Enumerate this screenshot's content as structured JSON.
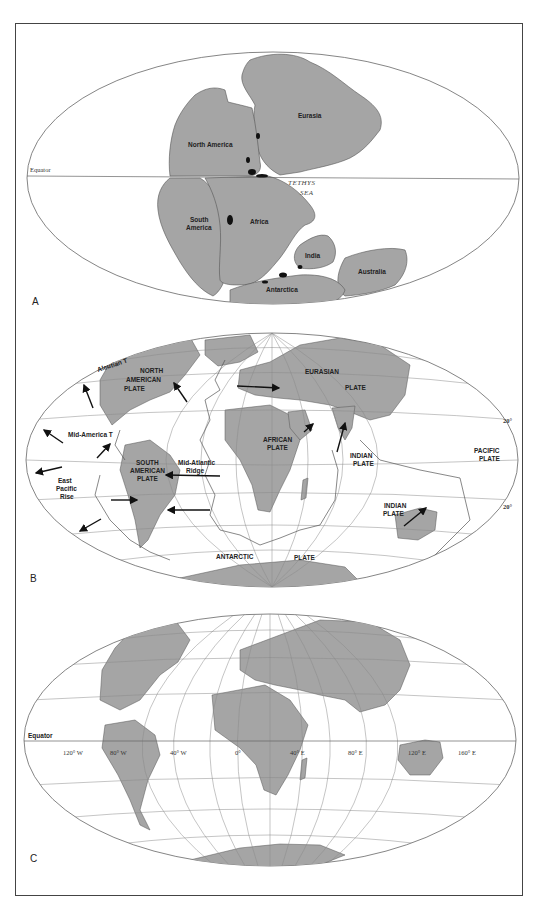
{
  "figure": {
    "colors": {
      "land": "#a5a5a5",
      "ocean": "#ffffff",
      "outline": "#555555",
      "grid": "#8a8a8a",
      "rift": "#000000"
    },
    "caption": ""
  },
  "panel_a": {
    "letter": "A",
    "equator_label": "Equator",
    "sea_label_line1": "TETHYS",
    "sea_label_line2": "SEA",
    "landmasses": {
      "north_america": "North America",
      "eurasia": "Eurasia",
      "south_america_line1": "South",
      "south_america_line2": "America",
      "africa": "Africa",
      "india": "India",
      "australia": "Australia",
      "antarctica": "Antarctica"
    }
  },
  "panel_b": {
    "letter": "B",
    "features": {
      "aleutian": "Aleutian T",
      "mid_america": "Mid-America T",
      "east_pacific_line1": "East",
      "east_pacific_line2": "Pacific",
      "east_pacific_line3": "Rise",
      "mid_atlantic_line1": "Mid-Atlantic",
      "mid_atlantic_line2": "Ridge"
    },
    "plates": {
      "north_american_line1": "NORTH",
      "north_american_line2": "AMERICAN",
      "north_american_line3": "PLATE",
      "eurasian_line1": "EURASIAN",
      "eurasian_line2": "PLATE",
      "african_line1": "AFRICAN",
      "african_line2": "PLATE",
      "south_american_line1": "SOUTH",
      "south_american_line2": "AMERICAN",
      "south_american_line3": "PLATE",
      "indian_line1": "INDIAN",
      "indian_line2": "PLATE",
      "indian_aus_line1": "INDIAN",
      "indian_aus_line2": "PLATE",
      "pacific_line1": "PACIFIC",
      "pacific_line2": "PLATE",
      "antarctic_word1": "ANTARCTIC",
      "antarctic_word2": "PLATE"
    },
    "latitude_labels": {
      "north": "20°",
      "south": "20°"
    }
  },
  "panel_c": {
    "letter": "C",
    "equator_label": "Equator",
    "longitude_labels": [
      "120° W",
      "80° W",
      "40° W",
      "0°",
      "40° E",
      "80° E",
      "120° E",
      "160° E"
    ]
  }
}
